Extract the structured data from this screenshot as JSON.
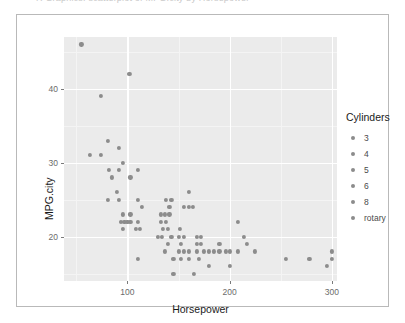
{
  "top_clipped_text": "R Graphics: scatterplot of MPG.city by Horsepower",
  "chart_data": {
    "type": "scatter",
    "title": "",
    "xlabel": "Horsepower",
    "ylabel": "MPG.city",
    "xlim": [
      38,
      305
    ],
    "ylim": [
      14,
      47
    ],
    "xticks": [
      100,
      200,
      300
    ],
    "yticks": [
      20,
      30,
      40
    ],
    "grid": true,
    "legend": {
      "position": "right",
      "title": "Cylinders",
      "entries": [
        "3",
        "4",
        "5",
        "6",
        "8",
        "rotary"
      ]
    },
    "point_color": "#8c8c8c",
    "panel_background": "#ebebeb",
    "points": [
      {
        "x": 55,
        "y": 46
      },
      {
        "x": 102,
        "y": 42
      },
      {
        "x": 74,
        "y": 39
      },
      {
        "x": 81,
        "y": 33
      },
      {
        "x": 63,
        "y": 31
      },
      {
        "x": 74,
        "y": 31
      },
      {
        "x": 92,
        "y": 32
      },
      {
        "x": 96,
        "y": 30
      },
      {
        "x": 82,
        "y": 29
      },
      {
        "x": 92,
        "y": 29
      },
      {
        "x": 110,
        "y": 29
      },
      {
        "x": 85,
        "y": 28
      },
      {
        "x": 103,
        "y": 28
      },
      {
        "x": 90,
        "y": 26
      },
      {
        "x": 81,
        "y": 25
      },
      {
        "x": 92,
        "y": 25
      },
      {
        "x": 110,
        "y": 25
      },
      {
        "x": 138,
        "y": 25
      },
      {
        "x": 143,
        "y": 25
      },
      {
        "x": 114,
        "y": 24
      },
      {
        "x": 141,
        "y": 24
      },
      {
        "x": 155,
        "y": 24
      },
      {
        "x": 160,
        "y": 24
      },
      {
        "x": 164,
        "y": 24
      },
      {
        "x": 96,
        "y": 23
      },
      {
        "x": 103,
        "y": 23
      },
      {
        "x": 133,
        "y": 23
      },
      {
        "x": 137,
        "y": 23
      },
      {
        "x": 141,
        "y": 23
      },
      {
        "x": 94,
        "y": 22
      },
      {
        "x": 97,
        "y": 22
      },
      {
        "x": 100,
        "y": 22
      },
      {
        "x": 103,
        "y": 22
      },
      {
        "x": 110,
        "y": 22
      },
      {
        "x": 133,
        "y": 22
      },
      {
        "x": 138,
        "y": 22
      },
      {
        "x": 160,
        "y": 26
      },
      {
        "x": 208,
        "y": 22
      },
      {
        "x": 96,
        "y": 21
      },
      {
        "x": 108,
        "y": 21
      },
      {
        "x": 112,
        "y": 21
      },
      {
        "x": 135,
        "y": 21
      },
      {
        "x": 140,
        "y": 21
      },
      {
        "x": 151,
        "y": 21
      },
      {
        "x": 130,
        "y": 20
      },
      {
        "x": 134,
        "y": 20
      },
      {
        "x": 143,
        "y": 20
      },
      {
        "x": 150,
        "y": 20
      },
      {
        "x": 155,
        "y": 20
      },
      {
        "x": 168,
        "y": 20
      },
      {
        "x": 172,
        "y": 20
      },
      {
        "x": 214,
        "y": 20
      },
      {
        "x": 140,
        "y": 19
      },
      {
        "x": 152,
        "y": 19
      },
      {
        "x": 168,
        "y": 19
      },
      {
        "x": 172,
        "y": 19
      },
      {
        "x": 190,
        "y": 19
      },
      {
        "x": 217,
        "y": 19
      },
      {
        "x": 137,
        "y": 18
      },
      {
        "x": 150,
        "y": 18
      },
      {
        "x": 155,
        "y": 18
      },
      {
        "x": 160,
        "y": 18
      },
      {
        "x": 168,
        "y": 18
      },
      {
        "x": 175,
        "y": 18
      },
      {
        "x": 180,
        "y": 18
      },
      {
        "x": 185,
        "y": 18
      },
      {
        "x": 190,
        "y": 18
      },
      {
        "x": 196,
        "y": 18
      },
      {
        "x": 200,
        "y": 18
      },
      {
        "x": 208,
        "y": 18
      },
      {
        "x": 225,
        "y": 18
      },
      {
        "x": 300,
        "y": 18
      },
      {
        "x": 110,
        "y": 17
      },
      {
        "x": 145,
        "y": 17
      },
      {
        "x": 152,
        "y": 17
      },
      {
        "x": 160,
        "y": 17
      },
      {
        "x": 170,
        "y": 17
      },
      {
        "x": 255,
        "y": 17
      },
      {
        "x": 278,
        "y": 17
      },
      {
        "x": 300,
        "y": 17
      },
      {
        "x": 180,
        "y": 16
      },
      {
        "x": 200,
        "y": 16
      },
      {
        "x": 295,
        "y": 16
      },
      {
        "x": 145,
        "y": 15
      },
      {
        "x": 165,
        "y": 15
      }
    ]
  }
}
